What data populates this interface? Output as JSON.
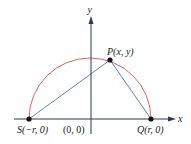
{
  "diagram": {
    "type": "semicircle-inscribed-triangle",
    "axes": {
      "x_label": "x",
      "y_label": "y"
    },
    "points": {
      "P": {
        "label": "P(x, y)"
      },
      "S": {
        "label": "S(−r, 0)"
      },
      "Q": {
        "label": "Q(r, 0)"
      },
      "O": {
        "label": "(0, 0)"
      }
    },
    "colors": {
      "semicircle": "#e05050",
      "triangle": "#4a78b8",
      "axes": "#2b3a55",
      "points": "#111111"
    }
  }
}
